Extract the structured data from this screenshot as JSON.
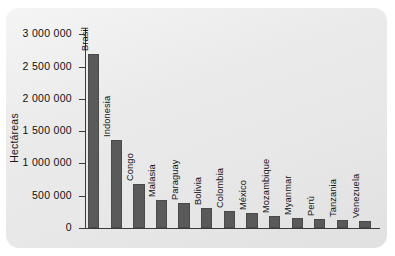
{
  "panel": {
    "background_color": "#e8e8e8",
    "bar_color": "#5a5a5a",
    "axis_color": "#3a3a3a"
  },
  "chart_data": {
    "type": "bar",
    "title": "",
    "xlabel": "",
    "ylabel": "Hectáreas",
    "ylim": [
      0,
      3100000
    ],
    "grid": false,
    "legend": "none",
    "ytick_labels": [
      "3 000 000",
      "2 500 000",
      "2 000 000",
      "1 500 000",
      "1 000 000",
      "500 000",
      "0"
    ],
    "ytick_values": [
      3000000,
      2500000,
      2000000,
      1500000,
      1000000,
      500000,
      0
    ],
    "categories": [
      "Brasil",
      "Indonesia",
      "Congo",
      "Malasia",
      "Paraguay",
      "Bolivia",
      "Colombia",
      "México",
      "Mozambique",
      "Myanmar",
      "Perú",
      "Tanzania",
      "Venezuela"
    ],
    "values": [
      2700000,
      1360000,
      680000,
      440000,
      380000,
      310000,
      270000,
      230000,
      190000,
      160000,
      140000,
      120000,
      110000
    ]
  }
}
